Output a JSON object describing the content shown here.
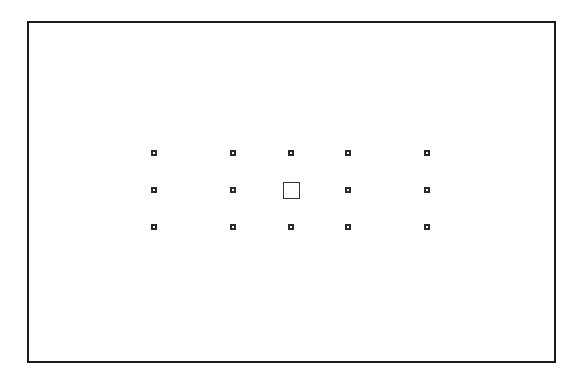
{
  "diagram": {
    "type": "autofocus-point-layout",
    "frame": {
      "x": 27,
      "y": 21,
      "width": 529,
      "height": 342,
      "border_color": "#1a1a1a"
    },
    "point_color": "#2a2a2a",
    "columns_x": [
      154,
      233,
      291,
      348,
      427
    ],
    "rows_y": [
      153,
      190,
      227
    ],
    "small_point_size": 6,
    "center_point_size": 17,
    "points": [
      {
        "id": "r1c1",
        "col": 0,
        "row": 0,
        "kind": "small"
      },
      {
        "id": "r1c2",
        "col": 1,
        "row": 0,
        "kind": "small"
      },
      {
        "id": "r1c3",
        "col": 2,
        "row": 0,
        "kind": "small"
      },
      {
        "id": "r1c4",
        "col": 3,
        "row": 0,
        "kind": "small"
      },
      {
        "id": "r1c5",
        "col": 4,
        "row": 0,
        "kind": "small"
      },
      {
        "id": "r2c1",
        "col": 0,
        "row": 1,
        "kind": "small"
      },
      {
        "id": "r2c2",
        "col": 1,
        "row": 1,
        "kind": "small"
      },
      {
        "id": "r2c3",
        "col": 2,
        "row": 1,
        "kind": "center"
      },
      {
        "id": "r2c4",
        "col": 3,
        "row": 1,
        "kind": "small"
      },
      {
        "id": "r2c5",
        "col": 4,
        "row": 1,
        "kind": "small"
      },
      {
        "id": "r3c1",
        "col": 0,
        "row": 2,
        "kind": "small"
      },
      {
        "id": "r3c2",
        "col": 1,
        "row": 2,
        "kind": "small"
      },
      {
        "id": "r3c3",
        "col": 2,
        "row": 2,
        "kind": "small"
      },
      {
        "id": "r3c4",
        "col": 3,
        "row": 2,
        "kind": "small"
      },
      {
        "id": "r3c5",
        "col": 4,
        "row": 2,
        "kind": "small"
      }
    ]
  }
}
